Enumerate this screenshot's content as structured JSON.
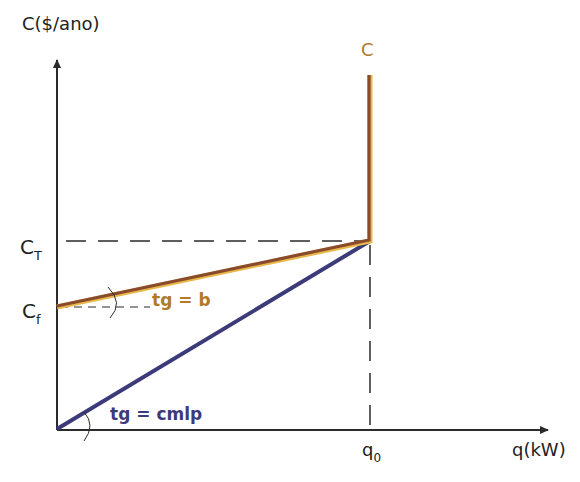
{
  "diagram": {
    "y_axis_label": "C($/ano)",
    "x_axis_label": "q(kW)",
    "curve_label": "C",
    "ct_label": "C",
    "ct_sub": "T",
    "cf_label": "C",
    "cf_sub": "f",
    "q0_label": "q",
    "q0_sub": "0",
    "brown_slope_label": "tg = b",
    "blue_slope_label": "tg = cmlp",
    "colors": {
      "axis": "#2b2b2b",
      "brown_line": "#8a4b2c",
      "brown_glow": "#e8b84a",
      "blue_line": "#3d3a7a",
      "label_brown": "#b07a2a",
      "label_blue": "#3d3a7a",
      "text": "#222222"
    }
  }
}
